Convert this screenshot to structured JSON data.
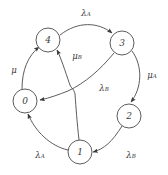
{
  "diagram": {
    "type": "directed-graph",
    "background_color": "#ffffff",
    "stroke_color": "#4a4a4a",
    "text_color": "#3a3a3a",
    "nodes": [
      {
        "id": "0",
        "label": "0",
        "cx": 25,
        "cy": 101,
        "r": 12
      },
      {
        "id": "1",
        "label": "1",
        "cx": 80,
        "cy": 152,
        "r": 12
      },
      {
        "id": "2",
        "label": "2",
        "cx": 129,
        "cy": 116,
        "r": 12
      },
      {
        "id": "3",
        "label": "3",
        "cx": 122,
        "cy": 43,
        "r": 12
      },
      {
        "id": "4",
        "label": "4",
        "cx": 48,
        "cy": 40,
        "r": 12
      }
    ],
    "edges": [
      {
        "id": "e-4-3",
        "from": "4",
        "to": "3",
        "label_base": "λ",
        "label_sub": "A",
        "label_x": 86,
        "label_y": 13
      },
      {
        "id": "e-3-2",
        "from": "3",
        "to": "2",
        "label_base": "μ",
        "label_sub": "A",
        "label_x": 152,
        "label_y": 75
      },
      {
        "id": "e-2-1",
        "from": "2",
        "to": "1",
        "label_base": "λ",
        "label_sub": "B",
        "label_x": 131,
        "label_y": 155
      },
      {
        "id": "e-1-0",
        "from": "1",
        "to": "0",
        "label_base": "λ",
        "label_sub": "A",
        "label_x": 40,
        "label_y": 155
      },
      {
        "id": "e-0-4",
        "from": "0",
        "to": "4",
        "label_base": "μ",
        "label_sub": "",
        "label_x": 14,
        "label_y": 70
      },
      {
        "id": "e-1-4",
        "from": "1",
        "to": "4",
        "label_base": "μ",
        "label_sub": "B",
        "label_x": 77,
        "label_y": 56
      },
      {
        "id": "e-3-0",
        "from": "3",
        "to": "0",
        "label_base": "λ",
        "label_sub": "B",
        "label_x": 104,
        "label_y": 88
      }
    ]
  }
}
